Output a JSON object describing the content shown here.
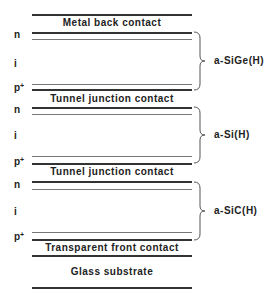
{
  "layers": {
    "metal": "Metal back contact",
    "tunnel1": "Tunnel junction contact",
    "tunnel2": "Tunnel junction contact",
    "transparent": "Transparent front contact",
    "glass": "Glass substrate"
  },
  "side": {
    "n": "n",
    "i": "i",
    "p": "p",
    "plus": "+"
  },
  "materials": [
    "a-SiGe(H)",
    "a-Si(H)",
    "a-SiC(H)"
  ]
}
